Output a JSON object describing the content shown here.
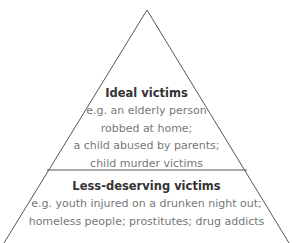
{
  "diagram": {
    "type": "pyramid",
    "colors": {
      "stroke": "#555555",
      "title": "#333333",
      "body": "#777777"
    },
    "tiers": [
      {
        "title": "Ideal victims",
        "lines": [
          "e.g. an elderly person",
          "robbed at home;",
          "a child abused by parents;",
          "child murder victims"
        ]
      },
      {
        "title": "Less-deserving victims",
        "lines": [
          "e.g. youth injured on a drunken night out;",
          "homeless people; prostitutes; drug addicts"
        ]
      }
    ]
  }
}
